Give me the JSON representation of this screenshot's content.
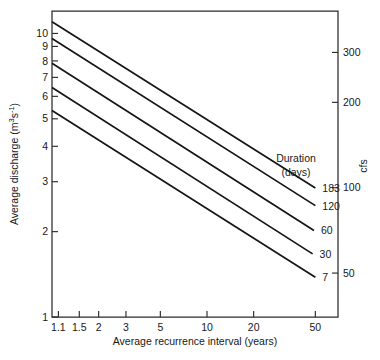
{
  "chart_data": {
    "type": "line",
    "title": "",
    "xlabel": "Average recurrence interval (years)",
    "ylabel": "Average discharge (m³s⁻¹)",
    "y2label": "cfs",
    "xscale": "log",
    "yscale": "log",
    "grid": false,
    "xlim": [
      1,
      70
    ],
    "ylim": [
      1,
      12
    ],
    "y2lim": [
      35,
      420
    ],
    "xticks": [
      "1.1",
      "1.5",
      "2",
      "3",
      "5",
      "10",
      "20",
      "50"
    ],
    "xtick_values": [
      1.1,
      1.5,
      2,
      3,
      5,
      10,
      20,
      50
    ],
    "yticks": [
      "1",
      "2",
      "3",
      "4",
      "5",
      "6",
      "7",
      "8",
      "9",
      "10"
    ],
    "ytick_values": [
      1,
      2,
      3,
      4,
      5,
      6,
      7,
      8,
      9,
      10
    ],
    "y2ticks": [
      "50",
      "100",
      "200",
      "300"
    ],
    "y2tick_values": [
      50,
      100,
      200,
      300
    ],
    "legend_title_line1": "Duration",
    "legend_title_line2": "(days)",
    "legend_position": "inside-right",
    "series": [
      {
        "name": "183",
        "label": "183",
        "x": [
          1.0,
          50.0
        ],
        "y": [
          11.0,
          2.85
        ]
      },
      {
        "name": "120",
        "label": "120",
        "x": [
          1.0,
          50.0
        ],
        "y": [
          9.6,
          2.47
        ]
      },
      {
        "name": "60",
        "label": "60",
        "x": [
          1.0,
          49.0
        ],
        "y": [
          7.85,
          2.02
        ]
      },
      {
        "name": "30",
        "label": "30",
        "x": [
          1.0,
          48.0
        ],
        "y": [
          6.45,
          1.67
        ]
      },
      {
        "name": "7",
        "label": "7",
        "x": [
          1.0,
          50.0
        ],
        "y": [
          5.35,
          1.38
        ]
      }
    ]
  },
  "colors": {
    "line": "#151515",
    "axis": "#2b2b2b",
    "background": "#ffffff",
    "text": "#181818"
  }
}
